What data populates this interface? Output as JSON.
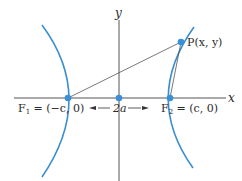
{
  "diagram": {
    "axes": {
      "x_label": "x",
      "y_label": "y"
    },
    "foci": {
      "f1_label_main": "F",
      "f1_label_sub": "1",
      "f1_label_rest": " = (−c, 0)",
      "f2_label_main": "F",
      "f2_label_sub": "2",
      "f2_label_rest": " = (c, 0)"
    },
    "point": {
      "label": "P(x, y)"
    },
    "vertex_distance": {
      "label": "2a"
    },
    "colors": {
      "curve": "#3b8fd0",
      "point": "#3a8fd6",
      "axis": "#555555",
      "lines": "#555555"
    }
  }
}
